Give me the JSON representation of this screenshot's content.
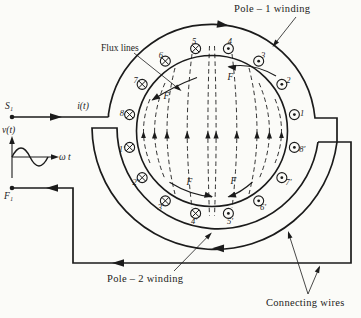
{
  "labels": {
    "pole1_winding": "Pole – 1 winding",
    "pole2_winding": "Pole – 2 winding",
    "flux_lines": "Flux lines",
    "connecting_wires": "Connecting wires",
    "source_terminal": "S₁",
    "finish_terminal": "F₁",
    "current": "i(t)",
    "voltage": "v(t)",
    "omega_t": "ω t",
    "force": "F⃗"
  },
  "conductors": [
    {
      "label": "1",
      "angle_deg": -11.25,
      "current": "out"
    },
    {
      "label": "2",
      "angle_deg": -33.75,
      "current": "out"
    },
    {
      "label": "3",
      "angle_deg": -56.25,
      "current": "out"
    },
    {
      "label": "4",
      "angle_deg": -78.75,
      "current": "out"
    },
    {
      "label": "5",
      "angle_deg": -101.25,
      "current": "in"
    },
    {
      "label": "6",
      "angle_deg": -123.75,
      "current": "in"
    },
    {
      "label": "7",
      "angle_deg": -146.25,
      "current": "in"
    },
    {
      "label": "8",
      "angle_deg": -168.75,
      "current": "in"
    },
    {
      "label": "1′",
      "angle_deg": 168.75,
      "current": "in"
    },
    {
      "label": "2′",
      "angle_deg": 146.25,
      "current": "in"
    },
    {
      "label": "3′",
      "angle_deg": 123.75,
      "current": "in"
    },
    {
      "label": "4′",
      "angle_deg": 101.25,
      "current": "in"
    },
    {
      "label": "5′",
      "angle_deg": 78.75,
      "current": "out"
    },
    {
      "label": "6′",
      "angle_deg": 56.25,
      "current": "out"
    },
    {
      "label": "7′",
      "angle_deg": 33.75,
      "current": "out"
    },
    {
      "label": "8′",
      "angle_deg": 11.25,
      "current": "out"
    }
  ]
}
